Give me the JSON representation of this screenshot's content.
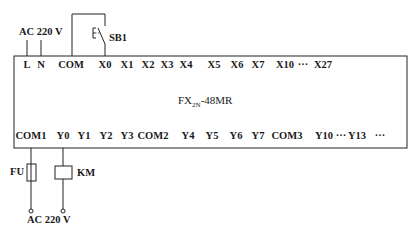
{
  "diagram": {
    "type": "PLC wiring diagram",
    "plc": {
      "model_prefix": "FX",
      "model_sub": "2N",
      "model_suffix": "-48MR"
    },
    "power_input_label": "AC 220 V",
    "output_supply_label": "AC 220 V",
    "switch_label": "SB1",
    "switch_symbol": "E\\",
    "top_terminals": [
      {
        "label": "L",
        "x": 27
      },
      {
        "label": "N",
        "x": 41
      },
      {
        "label": "COM",
        "x": 71
      },
      {
        "label": "X0",
        "x": 105
      },
      {
        "label": "X1",
        "x": 127
      },
      {
        "label": "X2",
        "x": 148
      },
      {
        "label": "X3",
        "x": 167
      },
      {
        "label": "X4",
        "x": 186
      },
      {
        "label": "X5",
        "x": 214
      },
      {
        "label": "X6",
        "x": 237
      },
      {
        "label": "X7",
        "x": 258
      },
      {
        "label": "X10",
        "x": 285
      },
      {
        "label": "···",
        "x": 303
      },
      {
        "label": "X27",
        "x": 323
      }
    ],
    "bottom_terminals": [
      {
        "label": "COM1",
        "x": 31
      },
      {
        "label": "Y0",
        "x": 63
      },
      {
        "label": "Y1",
        "x": 84
      },
      {
        "label": "Y2",
        "x": 106
      },
      {
        "label": "Y3",
        "x": 127
      },
      {
        "label": "COM2",
        "x": 153
      },
      {
        "label": "Y4",
        "x": 188
      },
      {
        "label": "Y5",
        "x": 212
      },
      {
        "label": "Y6",
        "x": 236
      },
      {
        "label": "Y7",
        "x": 258
      },
      {
        "label": "COM3",
        "x": 287
      },
      {
        "label": "Y10",
        "x": 324
      },
      {
        "label": "···",
        "x": 341
      },
      {
        "label": "Y13",
        "x": 357
      },
      {
        "label": "···",
        "x": 380
      }
    ],
    "components": {
      "fuse_label": "FU",
      "coil_label": "KM"
    }
  }
}
